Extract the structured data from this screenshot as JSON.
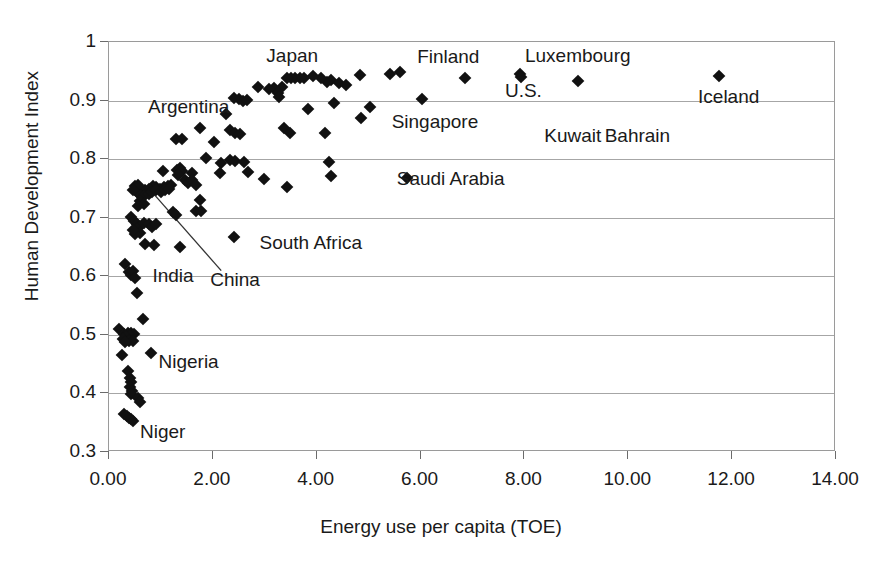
{
  "chart_data": {
    "type": "scatter",
    "title": "",
    "xlabel": "Energy use per capita (TOE)",
    "ylabel": "Human Development Index",
    "xlim": [
      0,
      14
    ],
    "ylim": [
      0.3,
      1.0
    ],
    "xticks": [
      "0.00",
      "2.00",
      "4.00",
      "6.00",
      "8.00",
      "10.00",
      "12.00",
      "14.00"
    ],
    "xtick_values": [
      0,
      2,
      4,
      6,
      8,
      10,
      12,
      14
    ],
    "yticks": [
      "0.3",
      "0.4",
      "0.5",
      "0.6",
      "0.7",
      "0.8",
      "0.9",
      "1"
    ],
    "ytick_values": [
      0.3,
      0.4,
      0.5,
      0.6,
      0.7,
      0.8,
      0.9,
      1.0
    ],
    "grid": "horizontal",
    "legend": "none",
    "marker": "diamond",
    "marker_color": "#111111",
    "annotations": [
      {
        "label": "Japan",
        "x": 3.55,
        "y": 0.975
      },
      {
        "label": "Finland",
        "x": 6.55,
        "y": 0.972
      },
      {
        "label": "Luxembourg",
        "x": 9.05,
        "y": 0.975
      },
      {
        "label": "Argentina",
        "x": 1.55,
        "y": 0.888
      },
      {
        "label": "U.S.",
        "x": 8.0,
        "y": 0.915
      },
      {
        "label": "Iceland",
        "x": 11.95,
        "y": 0.905
      },
      {
        "label": "Singapore",
        "x": 6.3,
        "y": 0.862
      },
      {
        "label": "Kuwait",
        "x": 8.95,
        "y": 0.838
      },
      {
        "label": "Bahrain",
        "x": 10.2,
        "y": 0.838
      },
      {
        "label": "Saudi Arabia",
        "x": 6.6,
        "y": 0.765
      },
      {
        "label": "South Africa",
        "x": 3.9,
        "y": 0.655
      },
      {
        "label": "India",
        "x": 1.25,
        "y": 0.598
      },
      {
        "label": "China",
        "x": 2.45,
        "y": 0.592
      },
      {
        "label": "Nigeria",
        "x": 1.55,
        "y": 0.452
      },
      {
        "label": "Niger",
        "x": 1.05,
        "y": 0.333
      }
    ],
    "leader_line": {
      "from_x": 2.18,
      "from_y": 0.608,
      "to_x": 0.82,
      "to_y": 0.745
    },
    "points": [
      {
        "x": 11.77,
        "y": 0.941
      },
      {
        "x": 9.05,
        "y": 0.932
      },
      {
        "x": 7.93,
        "y": 0.944
      },
      {
        "x": 7.95,
        "y": 0.939
      },
      {
        "x": 6.88,
        "y": 0.936
      },
      {
        "x": 5.62,
        "y": 0.947
      },
      {
        "x": 5.43,
        "y": 0.944
      },
      {
        "x": 4.85,
        "y": 0.942
      },
      {
        "x": 4.3,
        "y": 0.933
      },
      {
        "x": 4.22,
        "y": 0.93
      },
      {
        "x": 4.1,
        "y": 0.936
      },
      {
        "x": 3.95,
        "y": 0.94
      },
      {
        "x": 3.78,
        "y": 0.937
      },
      {
        "x": 3.7,
        "y": 0.936
      },
      {
        "x": 3.6,
        "y": 0.937
      },
      {
        "x": 3.52,
        "y": 0.936
      },
      {
        "x": 3.44,
        "y": 0.937
      },
      {
        "x": 3.35,
        "y": 0.922
      },
      {
        "x": 3.2,
        "y": 0.92
      },
      {
        "x": 3.1,
        "y": 0.918
      },
      {
        "x": 2.88,
        "y": 0.921
      },
      {
        "x": 4.45,
        "y": 0.929
      },
      {
        "x": 6.05,
        "y": 0.901
      },
      {
        "x": 4.58,
        "y": 0.925
      },
      {
        "x": 5.05,
        "y": 0.888
      },
      {
        "x": 4.88,
        "y": 0.868
      },
      {
        "x": 4.35,
        "y": 0.894
      },
      {
        "x": 3.85,
        "y": 0.884
      },
      {
        "x": 3.28,
        "y": 0.912
      },
      {
        "x": 3.3,
        "y": 0.905
      },
      {
        "x": 2.52,
        "y": 0.901
      },
      {
        "x": 2.6,
        "y": 0.898
      },
      {
        "x": 2.68,
        "y": 0.899
      },
      {
        "x": 2.42,
        "y": 0.903
      },
      {
        "x": 2.28,
        "y": 0.875
      },
      {
        "x": 3.38,
        "y": 0.851
      },
      {
        "x": 3.5,
        "y": 0.843
      },
      {
        "x": 2.35,
        "y": 0.848
      },
      {
        "x": 2.45,
        "y": 0.843
      },
      {
        "x": 2.55,
        "y": 0.842
      },
      {
        "x": 4.18,
        "y": 0.843
      },
      {
        "x": 1.78,
        "y": 0.851
      },
      {
        "x": 2.05,
        "y": 0.827
      },
      {
        "x": 1.3,
        "y": 0.832
      },
      {
        "x": 1.42,
        "y": 0.832
      },
      {
        "x": 4.25,
        "y": 0.793
      },
      {
        "x": 4.3,
        "y": 0.77
      },
      {
        "x": 5.75,
        "y": 0.766
      },
      {
        "x": 2.35,
        "y": 0.797
      },
      {
        "x": 2.45,
        "y": 0.795
      },
      {
        "x": 2.62,
        "y": 0.793
      },
      {
        "x": 2.18,
        "y": 0.792
      },
      {
        "x": 1.88,
        "y": 0.8
      },
      {
        "x": 2.15,
        "y": 0.775
      },
      {
        "x": 2.7,
        "y": 0.777
      },
      {
        "x": 1.62,
        "y": 0.775
      },
      {
        "x": 3.0,
        "y": 0.764
      },
      {
        "x": 3.45,
        "y": 0.751
      },
      {
        "x": 1.05,
        "y": 0.778
      },
      {
        "x": 1.32,
        "y": 0.779
      },
      {
        "x": 1.38,
        "y": 0.784
      },
      {
        "x": 1.42,
        "y": 0.778
      },
      {
        "x": 1.35,
        "y": 0.771
      },
      {
        "x": 1.48,
        "y": 0.762
      },
      {
        "x": 1.55,
        "y": 0.758
      },
      {
        "x": 1.62,
        "y": 0.762
      },
      {
        "x": 1.7,
        "y": 0.755
      },
      {
        "x": 1.22,
        "y": 0.755
      },
      {
        "x": 1.15,
        "y": 0.752
      },
      {
        "x": 1.08,
        "y": 0.75
      },
      {
        "x": 1.0,
        "y": 0.748
      },
      {
        "x": 0.92,
        "y": 0.75
      },
      {
        "x": 0.86,
        "y": 0.752
      },
      {
        "x": 0.78,
        "y": 0.748
      },
      {
        "x": 0.72,
        "y": 0.745
      },
      {
        "x": 0.66,
        "y": 0.745
      },
      {
        "x": 0.6,
        "y": 0.748
      },
      {
        "x": 0.55,
        "y": 0.742
      },
      {
        "x": 0.62,
        "y": 0.737
      },
      {
        "x": 0.7,
        "y": 0.735
      },
      {
        "x": 0.78,
        "y": 0.738
      },
      {
        "x": 0.85,
        "y": 0.742
      },
      {
        "x": 0.93,
        "y": 0.745
      },
      {
        "x": 1.02,
        "y": 0.742
      },
      {
        "x": 1.1,
        "y": 0.745
      },
      {
        "x": 1.18,
        "y": 0.748
      },
      {
        "x": 0.52,
        "y": 0.752
      },
      {
        "x": 0.58,
        "y": 0.755
      },
      {
        "x": 0.48,
        "y": 0.745
      },
      {
        "x": 0.62,
        "y": 0.726
      },
      {
        "x": 0.7,
        "y": 0.722
      },
      {
        "x": 0.58,
        "y": 0.718
      },
      {
        "x": 1.7,
        "y": 0.71
      },
      {
        "x": 1.78,
        "y": 0.728
      },
      {
        "x": 1.8,
        "y": 0.71
      },
      {
        "x": 1.25,
        "y": 0.708
      },
      {
        "x": 1.3,
        "y": 0.703
      },
      {
        "x": 0.45,
        "y": 0.7
      },
      {
        "x": 0.5,
        "y": 0.693
      },
      {
        "x": 0.55,
        "y": 0.688
      },
      {
        "x": 0.58,
        "y": 0.68
      },
      {
        "x": 0.62,
        "y": 0.672
      },
      {
        "x": 0.52,
        "y": 0.67
      },
      {
        "x": 0.48,
        "y": 0.678
      },
      {
        "x": 0.7,
        "y": 0.69
      },
      {
        "x": 0.78,
        "y": 0.688
      },
      {
        "x": 0.85,
        "y": 0.682
      },
      {
        "x": 0.92,
        "y": 0.688
      },
      {
        "x": 2.42,
        "y": 0.665
      },
      {
        "x": 0.72,
        "y": 0.653
      },
      {
        "x": 0.88,
        "y": 0.652
      },
      {
        "x": 1.38,
        "y": 0.648
      },
      {
        "x": 0.32,
        "y": 0.62
      },
      {
        "x": 0.4,
        "y": 0.605
      },
      {
        "x": 0.45,
        "y": 0.6
      },
      {
        "x": 0.48,
        "y": 0.608
      },
      {
        "x": 0.52,
        "y": 0.595
      },
      {
        "x": 0.55,
        "y": 0.57
      },
      {
        "x": 0.68,
        "y": 0.525
      },
      {
        "x": 0.22,
        "y": 0.508
      },
      {
        "x": 0.3,
        "y": 0.5
      },
      {
        "x": 0.38,
        "y": 0.502
      },
      {
        "x": 0.45,
        "y": 0.502
      },
      {
        "x": 0.5,
        "y": 0.5
      },
      {
        "x": 0.42,
        "y": 0.497
      },
      {
        "x": 0.35,
        "y": 0.494
      },
      {
        "x": 0.28,
        "y": 0.492
      },
      {
        "x": 0.4,
        "y": 0.487
      },
      {
        "x": 0.48,
        "y": 0.488
      },
      {
        "x": 0.33,
        "y": 0.486
      },
      {
        "x": 0.82,
        "y": 0.468
      },
      {
        "x": 0.26,
        "y": 0.464
      },
      {
        "x": 0.38,
        "y": 0.437
      },
      {
        "x": 0.42,
        "y": 0.425
      },
      {
        "x": 0.45,
        "y": 0.418
      },
      {
        "x": 0.43,
        "y": 0.41
      },
      {
        "x": 0.46,
        "y": 0.403
      },
      {
        "x": 0.44,
        "y": 0.398
      },
      {
        "x": 0.58,
        "y": 0.39
      },
      {
        "x": 0.62,
        "y": 0.383
      },
      {
        "x": 0.3,
        "y": 0.363
      },
      {
        "x": 0.36,
        "y": 0.36
      },
      {
        "x": 0.4,
        "y": 0.357
      },
      {
        "x": 0.44,
        "y": 0.355
      },
      {
        "x": 0.48,
        "y": 0.352
      }
    ]
  }
}
